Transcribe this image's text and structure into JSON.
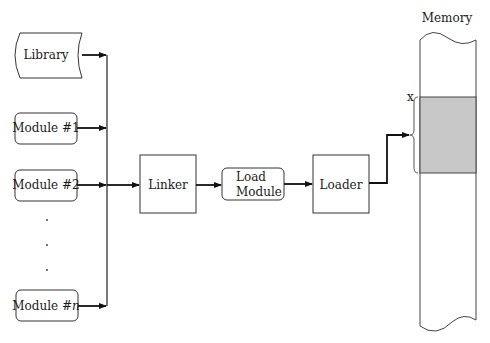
{
  "diagram": {
    "inputs": [
      {
        "id": "library",
        "label": "Library",
        "shape": "stored-data"
      },
      {
        "id": "module1",
        "label": "Module #1",
        "shape": "rounded-rect"
      },
      {
        "id": "module2",
        "label": "Module #2",
        "shape": "rounded-rect"
      },
      {
        "id": "modulen",
        "label_prefix": "Module #",
        "label_italic": "n",
        "shape": "rounded-rect"
      }
    ],
    "ellipsis": [
      ".",
      ".",
      "."
    ],
    "linker": {
      "label": "Linker"
    },
    "load_module": {
      "line1": "Load",
      "line2": "Module"
    },
    "loader": {
      "label": "Loader"
    },
    "memory": {
      "title": "Memory",
      "address_label": "x",
      "loaded_region_color": "#c8c8c8"
    },
    "edges": [
      {
        "from": "Library",
        "to": "Linker"
      },
      {
        "from": "Module #1",
        "to": "Linker"
      },
      {
        "from": "Module #2",
        "to": "Linker"
      },
      {
        "from": "Module #n",
        "to": "Linker"
      },
      {
        "from": "Linker",
        "to": "Load Module"
      },
      {
        "from": "Load Module",
        "to": "Loader"
      },
      {
        "from": "Loader",
        "to": "Memory"
      }
    ]
  }
}
